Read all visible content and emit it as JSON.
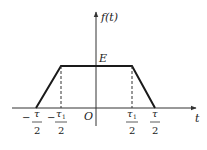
{
  "diagram": {
    "type": "trapezoidal pulse",
    "y_axis_label": "f(t)",
    "x_axis_label": "t",
    "origin_label": "O",
    "amplitude_label": "E",
    "ticks": [
      {
        "sign": "−",
        "numerator": "τ",
        "subscript": "",
        "denominator": "2"
      },
      {
        "sign": "−",
        "numerator": "τ",
        "subscript": "1",
        "denominator": "2"
      },
      {
        "sign": "",
        "numerator": "τ",
        "subscript": "1",
        "denominator": "2"
      },
      {
        "sign": "",
        "numerator": "τ",
        "subscript": "",
        "denominator": "2"
      }
    ],
    "colors": {
      "line": "#1a1a1a",
      "axis": "#333333",
      "dashed": "#333333"
    }
  }
}
